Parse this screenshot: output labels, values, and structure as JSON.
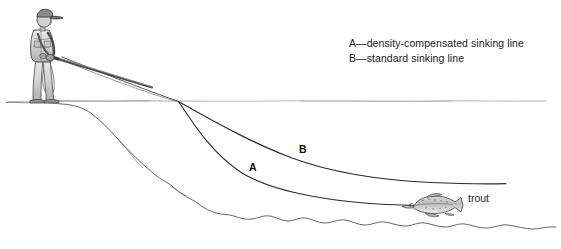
{
  "figure": {
    "title_visible": false,
    "background_color": "#ffffff",
    "ink_color": "#3a3a3a",
    "text_color": "#1a1a1a",
    "waterline_color": "#b8b8b8"
  },
  "legend": {
    "entries": [
      "A—density-compensated sinking line",
      "B—standard sinking line"
    ]
  },
  "labels": {
    "line_a": "A",
    "line_b": "B",
    "fish": "trout"
  },
  "scene": {
    "angler": {
      "name": "angler-figure",
      "description": "standing fly angler wearing cap holding rod"
    },
    "water_surface": {
      "name": "water-surface-line"
    },
    "lake_bottom": {
      "name": "lake-bottom-contour"
    },
    "fish": {
      "name": "trout-illustration"
    },
    "lines": [
      {
        "id": "A",
        "name": "density-compensated-sinking-line"
      },
      {
        "id": "B",
        "name": "standard-sinking-line"
      }
    ]
  }
}
